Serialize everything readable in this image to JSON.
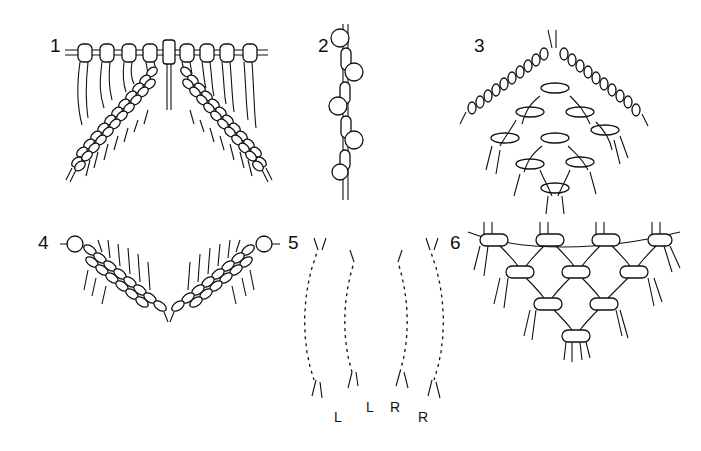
{
  "figure": {
    "panels": [
      {
        "id": 1,
        "label": "1",
        "depicts": "two diagonal rows of half hitches hanging from a holding cord with lark's-head mounting"
      },
      {
        "id": 2,
        "label": "2",
        "depicts": "vertical chain of interlocking loops"
      },
      {
        "id": 3,
        "label": "3",
        "depicts": "diamond of diagonal half hitches around a woven center"
      },
      {
        "id": 4,
        "label": "4",
        "depicts": "two opposing diagonal bands of half hitches forming a V"
      },
      {
        "id": 5,
        "label": "5",
        "depicts": "four curved sinnets of spiral knots",
        "sublabels": [
          "L",
          "L",
          "R",
          "R"
        ]
      },
      {
        "id": 6,
        "label": "6",
        "depicts": "inverted triangle of interlaced knot loops"
      }
    ],
    "colors": {
      "ink": "#111111",
      "background": "#ffffff"
    }
  }
}
